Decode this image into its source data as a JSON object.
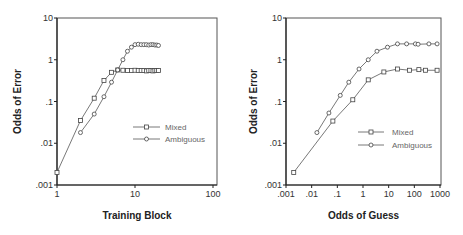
{
  "chart_data": [
    {
      "type": "line",
      "title": "",
      "xlabel": "Training Block",
      "ylabel": "Odds of Error",
      "xscale": "log",
      "yscale": "log",
      "xlim": [
        1,
        100
      ],
      "ylim": [
        0.001,
        10
      ],
      "xticks": [
        1,
        10,
        100
      ],
      "xtick_labels": [
        "1",
        "10",
        "100"
      ],
      "yticks": [
        0.001,
        0.01,
        0.1,
        1,
        10
      ],
      "ytick_labels": [
        ".001",
        ".01",
        ".1",
        "1",
        "10"
      ],
      "grid": false,
      "legend_position": "center-right",
      "series": [
        {
          "name": "Mixed",
          "marker": "square",
          "x": [
            1,
            2,
            3,
            4,
            5,
            6,
            7,
            8,
            9,
            10,
            11,
            12,
            13,
            14,
            15,
            16,
            17,
            18,
            19,
            20
          ],
          "y": [
            0.002,
            0.035,
            0.12,
            0.32,
            0.5,
            0.57,
            0.56,
            0.55,
            0.55,
            0.56,
            0.55,
            0.55,
            0.55,
            0.54,
            0.55,
            0.55,
            0.54,
            0.55,
            0.55,
            0.55
          ]
        },
        {
          "name": "Ambiguous",
          "marker": "circle",
          "x": [
            2,
            3,
            4,
            5,
            6,
            7,
            8,
            9,
            10,
            11,
            12,
            13,
            14,
            15,
            16,
            17,
            18,
            19,
            20
          ],
          "y": [
            0.018,
            0.05,
            0.13,
            0.29,
            0.57,
            1.0,
            1.6,
            2.0,
            2.3,
            2.35,
            2.3,
            2.3,
            2.3,
            2.25,
            2.3,
            2.3,
            2.25,
            2.25,
            2.2
          ]
        }
      ]
    },
    {
      "type": "line",
      "title": "",
      "xlabel": "Odds of Guess",
      "ylabel": "Odds of Error",
      "xscale": "log",
      "yscale": "log",
      "xlim": [
        0.001,
        1000
      ],
      "ylim": [
        0.001,
        10
      ],
      "xticks": [
        0.001,
        0.01,
        0.1,
        1,
        10,
        100,
        1000
      ],
      "xtick_labels": [
        ".001",
        ".01",
        ".1",
        "1",
        "10",
        "100",
        "1000"
      ],
      "yticks": [
        0.001,
        0.01,
        0.1,
        1,
        10
      ],
      "ytick_labels": [
        ".001",
        ".01",
        ".1",
        "1",
        "10"
      ],
      "grid": false,
      "legend_position": "center-right",
      "series": [
        {
          "name": "Mixed",
          "marker": "square",
          "x": [
            0.002,
            0.067,
            0.4,
            1.6,
            6.5,
            22,
            65,
            150,
            270,
            770
          ],
          "y": [
            0.002,
            0.034,
            0.11,
            0.33,
            0.51,
            0.6,
            0.56,
            0.58,
            0.56,
            0.56
          ]
        },
        {
          "name": "Ambiguous",
          "marker": "circle",
          "x": [
            0.016,
            0.047,
            0.13,
            0.28,
            0.7,
            1.6,
            3.5,
            9,
            22,
            50,
            110,
            140,
            370,
            770
          ],
          "y": [
            0.018,
            0.053,
            0.14,
            0.29,
            0.6,
            1.0,
            1.6,
            2.0,
            2.4,
            2.4,
            2.4,
            2.35,
            2.4,
            2.4
          ]
        }
      ]
    }
  ],
  "layout": {
    "panels": [
      {
        "left": 57,
        "right": 213,
        "top": 18,
        "bottom": 185,
        "frame_right": 217,
        "ylabel_x": 21,
        "xlabel_y": 219,
        "legend": {
          "x1": 133,
          "x2": 160,
          "text_x": 165,
          "y": [
            127,
            139
          ]
        }
      },
      {
        "left": 286,
        "right": 440,
        "top": 18,
        "bottom": 185,
        "frame_right": 441,
        "ylabel_x": 257,
        "xlabel_y": 219,
        "legend": {
          "x1": 358,
          "x2": 384,
          "text_x": 392,
          "y": [
            132,
            145
          ]
        }
      }
    ]
  }
}
